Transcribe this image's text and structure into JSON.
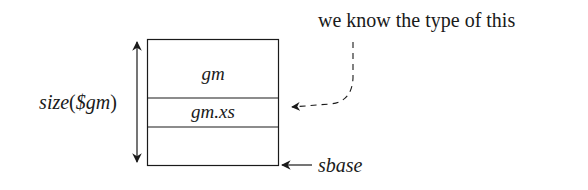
{
  "diagram": {
    "annotation": "we know the type of this",
    "size_label": "size($gm)",
    "size_label_parts": {
      "fn": "size",
      "open": "(",
      "arg": "$gm",
      "close": ")"
    },
    "cells": [
      {
        "label": "gm"
      },
      {
        "label": "gm.xs"
      },
      {
        "label": ""
      }
    ],
    "base_label": "sbase",
    "colors": {
      "stroke": "#1a1a1a",
      "text": "#1a1a1a",
      "background": "#ffffff"
    }
  }
}
